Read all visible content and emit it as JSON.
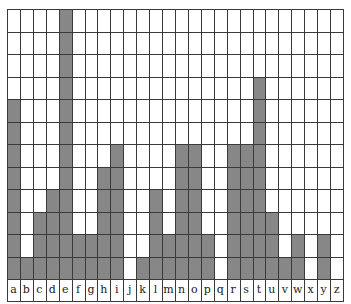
{
  "chart_data": {
    "type": "bar",
    "title": "",
    "xlabel": "",
    "ylabel": "",
    "categories": [
      "a",
      "b",
      "c",
      "d",
      "e",
      "f",
      "g",
      "h",
      "i",
      "j",
      "k",
      "l",
      "m",
      "n",
      "o",
      "p",
      "q",
      "r",
      "s",
      "t",
      "u",
      "v",
      "w",
      "x",
      "y",
      "z"
    ],
    "values": [
      8,
      1,
      3,
      4,
      12,
      2,
      2,
      5,
      6,
      0,
      1,
      4,
      2,
      6,
      6,
      2,
      0,
      6,
      6,
      9,
      3,
      1,
      2,
      0,
      2,
      0
    ],
    "ylim": [
      0,
      12
    ],
    "grid": true,
    "legend": null,
    "colors": {
      "bar": "#878787",
      "grid": "#3a3a3a",
      "background": "#ffffff"
    }
  }
}
